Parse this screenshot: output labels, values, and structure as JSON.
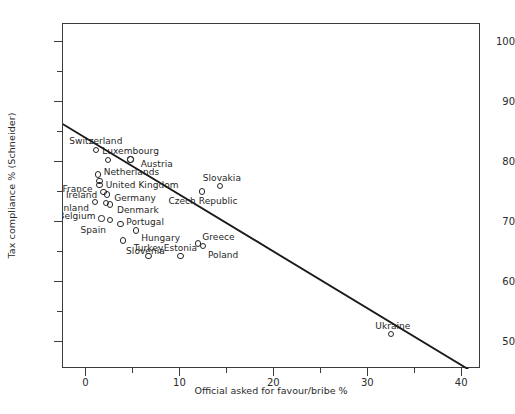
{
  "chart_data": {
    "type": "scatter",
    "title": "",
    "xlabel": "Official asked for favour/bribe %",
    "ylabel": "Tax compliance % (Schneider)",
    "xlim": [
      -2.5,
      42
    ],
    "ylim": [
      45.5,
      103
    ],
    "grid": false,
    "legend": null,
    "xticks": [
      0,
      10,
      20,
      30,
      40
    ],
    "xticks_minor": [
      5,
      15,
      25,
      35
    ],
    "yticks": [
      50,
      60,
      70,
      80,
      90,
      100
    ],
    "yticks_minor": [
      55,
      65,
      75,
      85,
      95
    ],
    "points": [
      {
        "label": "Switzerland",
        "x": 1.0,
        "y": 82.0,
        "label_dx": 0,
        "label_dy": -9,
        "anchor": "mid"
      },
      {
        "label": "",
        "x": 2.3,
        "y": 80.3,
        "label_dx": 0,
        "label_dy": 0,
        "anchor": "mid"
      },
      {
        "label": "Luxembourg",
        "x": 4.7,
        "y": 80.4,
        "label_dx": 0,
        "label_dy": -9,
        "anchor": "mid"
      },
      {
        "label": "Austria",
        "x": 4.7,
        "y": 80.4,
        "label_dx": 10,
        "label_dy": 4,
        "anchor": "start"
      },
      {
        "label": "Netherlands",
        "x": 1.2,
        "y": 77.9,
        "label_dx": 6,
        "label_dy": -3,
        "anchor": "start"
      },
      {
        "label": "United Kingdom",
        "x": 1.4,
        "y": 76.8,
        "label_dx": 6,
        "label_dy": 4,
        "anchor": "start"
      },
      {
        "label": "France",
        "x": 1.4,
        "y": 76.2,
        "label_dx": -7,
        "label_dy": 4,
        "anchor": "end"
      },
      {
        "label": "Ireland",
        "x": 1.8,
        "y": 75.0,
        "label_dx": -6,
        "label_dy": 3,
        "anchor": "end"
      },
      {
        "label": "Germany",
        "x": 2.2,
        "y": 74.6,
        "label_dx": 7,
        "label_dy": 4,
        "anchor": "start"
      },
      {
        "label": "Finland",
        "x": 0.9,
        "y": 73.3,
        "label_dx": -6,
        "label_dy": 6,
        "anchor": "end"
      },
      {
        "label": "",
        "x": 2.1,
        "y": 73.2,
        "label_dx": 0,
        "label_dy": 0,
        "anchor": "mid"
      },
      {
        "label": "Denmark",
        "x": 2.5,
        "y": 72.9,
        "label_dx": 7,
        "label_dy": 5,
        "anchor": "start"
      },
      {
        "label": "Belgium",
        "x": 1.6,
        "y": 70.6,
        "label_dx": -6,
        "label_dy": -2,
        "anchor": "end"
      },
      {
        "label": "Spain",
        "x": 2.5,
        "y": 70.3,
        "label_dx": -4,
        "label_dy": 10,
        "anchor": "end"
      },
      {
        "label": "Portugal",
        "x": 3.6,
        "y": 69.7,
        "label_dx": 6,
        "label_dy": -2,
        "anchor": "start"
      },
      {
        "label": "Hungary",
        "x": 5.3,
        "y": 68.6,
        "label_dx": 5,
        "label_dy": 8,
        "anchor": "start"
      },
      {
        "label": "Slovenia",
        "x": 3.9,
        "y": 66.9,
        "label_dx": 3,
        "label_dy": 10,
        "anchor": "start"
      },
      {
        "label": "Turkey",
        "x": 6.6,
        "y": 64.3,
        "label_dx": 0,
        "label_dy": -8,
        "anchor": "mid"
      },
      {
        "label": "Estonia",
        "x": 10.0,
        "y": 64.3,
        "label_dx": 0,
        "label_dy": -8,
        "anchor": "mid"
      },
      {
        "label": "Czech Republic",
        "x": 12.3,
        "y": 75.1,
        "label_dx": 1,
        "label_dy": 10,
        "anchor": "mid"
      },
      {
        "label": "Slovakia",
        "x": 14.2,
        "y": 76.0,
        "label_dx": 2,
        "label_dy": -8,
        "anchor": "mid"
      },
      {
        "label": "Greece",
        "x": 11.9,
        "y": 66.4,
        "label_dx": 4,
        "label_dy": -7,
        "anchor": "start"
      },
      {
        "label": "Poland",
        "x": 12.4,
        "y": 66.0,
        "label_dx": 5,
        "label_dy": 9,
        "anchor": "start"
      },
      {
        "label": "Ukraine",
        "x": 32.4,
        "y": 51.3,
        "label_dx": 2,
        "label_dy": -8,
        "anchor": "mid"
      }
    ],
    "trendline": {
      "x0": -2.5,
      "y0": 86.3,
      "x1": 40.6,
      "y1": 45.5
    }
  }
}
